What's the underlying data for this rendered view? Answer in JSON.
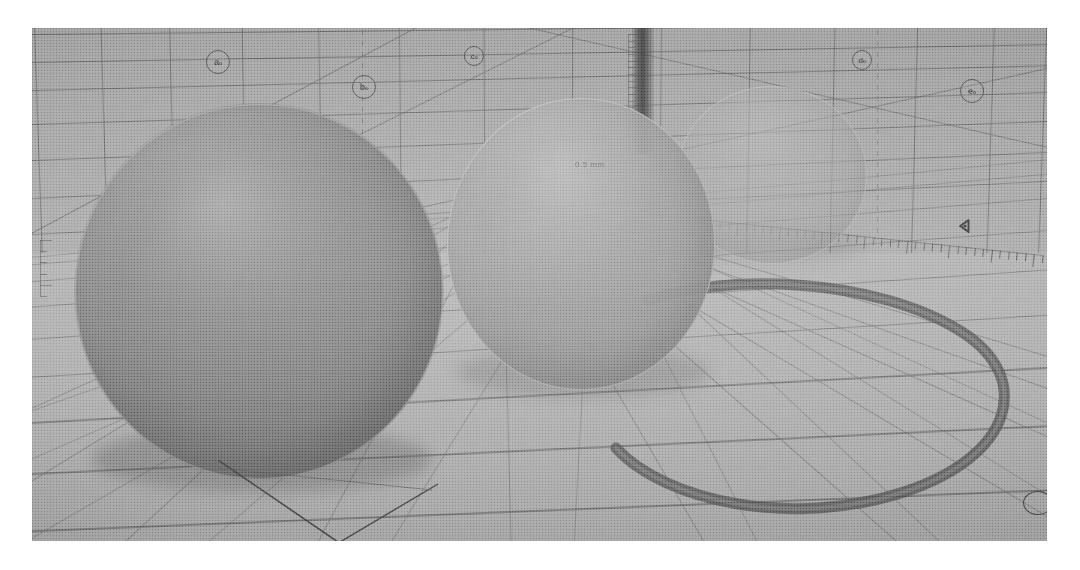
{
  "scene": {
    "title": "Halftone photograph of a 3D grid-room render with three spheres",
    "medium": "printed halftone photograph on white paper",
    "palette": {
      "paper_white": "#ffffff",
      "wall_gray": "#a7a7a7",
      "floor_gray": "#b0b0b0",
      "grid_line": "#5e5e5e",
      "floor_line": "#686868",
      "sphere_front": "#888888",
      "sphere_middle": "#9c9c9c",
      "sphere_back": "#a4a4a4",
      "ring_dark": "#4a4a4a",
      "pillar_dark": "#3a3a3a",
      "ink_dark": "#3c3c3c"
    }
  },
  "photo": {
    "left": 32,
    "top": 28,
    "width": 1015,
    "height": 513,
    "border_label": "photo-edge"
  },
  "wall": {
    "label": "back-wall-grid",
    "horizontal_lines": [
      {
        "y": 6,
        "tilt": -0.6
      },
      {
        "y": 34,
        "tilt": -1.0
      },
      {
        "y": 62,
        "tilt": -1.4
      },
      {
        "y": 96,
        "tilt": -1.8
      },
      {
        "y": 132,
        "tilt": -2.2
      },
      {
        "y": 170,
        "tilt": -2.6
      },
      {
        "y": 206,
        "tilt": -3.0
      }
    ],
    "vertical_lines_x": [
      6,
      72,
      140,
      212,
      288,
      368,
      452,
      540,
      628,
      716,
      800,
      882,
      958,
      1010
    ],
    "dashed_guides_x": [
      330,
      845
    ]
  },
  "floor": {
    "label": "floor-grid",
    "receding_lines": 7,
    "lateral_lines": 9,
    "diagonal_lines": 6
  },
  "spheres": [
    {
      "name": "sphere-front",
      "order": 1,
      "opacity": "opaque",
      "radius_px": 184,
      "center": [
        227,
        264
      ]
    },
    {
      "name": "sphere-middle",
      "order": 2,
      "opacity": "translucent",
      "radius_px": 134,
      "center": [
        549,
        216
      ]
    },
    {
      "name": "sphere-back",
      "order": 3,
      "opacity": "ghosted",
      "radius_px": 95,
      "center": [
        740,
        147
      ]
    }
  ],
  "markers": {
    "nodes": [
      {
        "id": "node-a",
        "glyph": "a₀",
        "x": 174,
        "y": 22,
        "size": "lg"
      },
      {
        "id": "node-b",
        "glyph": "b₀",
        "x": 320,
        "y": 47,
        "size": "lg"
      },
      {
        "id": "node-c",
        "glyph": "c₀",
        "x": 432,
        "y": 18,
        "size": "sm"
      },
      {
        "id": "node-d",
        "glyph": "d₀",
        "x": 820,
        "y": 22,
        "size": "sm"
      },
      {
        "id": "node-e",
        "glyph": "e₀",
        "x": 928,
        "y": 51,
        "size": "lg"
      }
    ],
    "triangle_marker": {
      "id": "pivot-marker",
      "x": 925,
      "y": 196
    },
    "corner_marker": {
      "id": "corner-node",
      "position": "bottom-right"
    }
  },
  "rulers": [
    {
      "id": "ruler-left",
      "orientation": "vertical",
      "ticks": 5,
      "x": 8,
      "y": 212,
      "length": 56
    },
    {
      "id": "ruler-pillar",
      "orientation": "vertical",
      "ticks": 18,
      "x": 596,
      "y": 6,
      "length": 120
    },
    {
      "id": "ruler-floor",
      "orientation": "horizontal",
      "ticks": 46,
      "x": 620,
      "y": 186,
      "length": 392
    }
  ],
  "ring": {
    "id": "floor-ellipse-ring",
    "note": "large dark elliptical band painted on the grid floor",
    "stroke": "#4e4e4e",
    "stroke_light": "#7b7b7b"
  },
  "annotations": {
    "sphere_text": "0.5 mm",
    "floor_text": ""
  }
}
